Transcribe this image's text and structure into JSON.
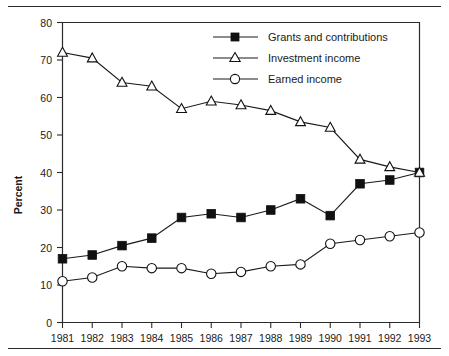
{
  "chart_data": {
    "type": "line",
    "title": "",
    "xlabel": "",
    "ylabel": "Percent",
    "ylim": [
      0,
      80
    ],
    "ytick_step": 10,
    "grid": false,
    "legend_position": "top-right",
    "categories": [
      "1981",
      "1982",
      "1983",
      "1984",
      "1985",
      "1986",
      "1987",
      "1988",
      "1989",
      "1990",
      "1991",
      "1992",
      "1993"
    ],
    "yticks": [
      "0",
      "10",
      "20",
      "30",
      "40",
      "50",
      "60",
      "70",
      "80"
    ],
    "series": [
      {
        "name": "Grants and contributions",
        "marker": "filled-square",
        "values": [
          17,
          18,
          20.5,
          22.5,
          28,
          29,
          28,
          30,
          33,
          28.5,
          37,
          38,
          40
        ]
      },
      {
        "name": "Investment income",
        "marker": "open-triangle",
        "values": [
          72,
          70.5,
          64,
          63,
          57,
          59,
          58,
          56.5,
          53.5,
          52,
          43.5,
          41.5,
          40
        ]
      },
      {
        "name": "Earned income",
        "marker": "open-circle",
        "values": [
          11,
          12,
          15,
          14.5,
          14.5,
          13,
          13.5,
          15,
          15.5,
          21,
          22,
          23,
          24
        ]
      }
    ]
  },
  "legend": {
    "items": [
      {
        "label": "Grants and contributions",
        "marker": "filled-square"
      },
      {
        "label": "Investment income",
        "marker": "open-triangle"
      },
      {
        "label": "Earned income",
        "marker": "open-circle"
      }
    ]
  },
  "axes": {
    "y_title": "Percent",
    "y_labels": [
      "80",
      "70",
      "60",
      "50",
      "40",
      "30",
      "20",
      "10",
      "0"
    ],
    "x_labels": [
      "1981",
      "1982",
      "1983",
      "1984",
      "1985",
      "1986",
      "1987",
      "1988",
      "1989",
      "1990",
      "1991",
      "1992",
      "1993"
    ]
  },
  "colors": {
    "ink": "#1a1a1a",
    "marker_fill": "#111111",
    "background": "#ffffff"
  }
}
